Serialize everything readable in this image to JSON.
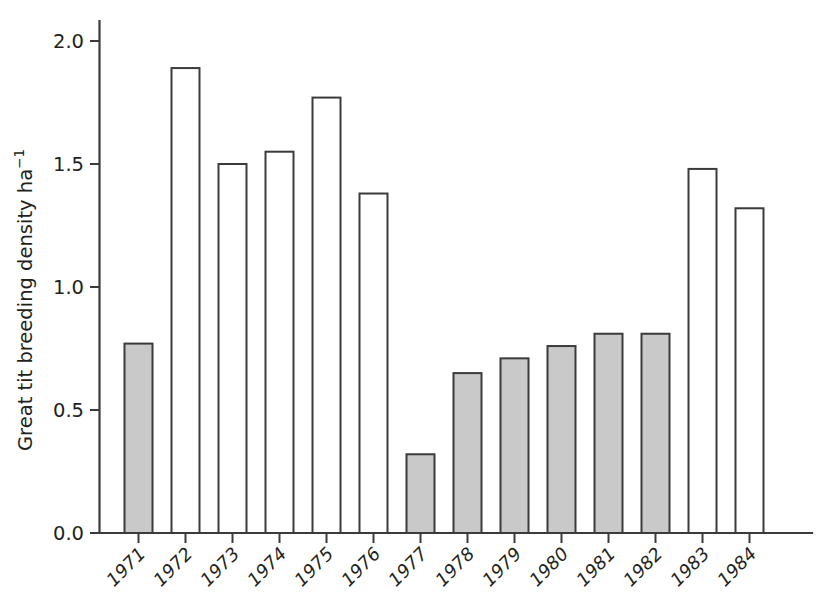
{
  "chart_data": {
    "type": "bar",
    "title": "",
    "subtitle": "",
    "xlabel": "",
    "ylabel": "Great tit breeding density ha",
    "ylabel_exponent": "−1",
    "ylabel_full": "Great tit breeding density ha⁻¹",
    "categories": [
      "1971",
      "1972",
      "1973",
      "1974",
      "1975",
      "1976",
      "1977",
      "1978",
      "1979",
      "1980",
      "1981",
      "1982",
      "1983",
      "1984"
    ],
    "values": [
      0.77,
      1.89,
      1.5,
      1.55,
      1.77,
      1.38,
      0.32,
      0.65,
      0.71,
      0.76,
      0.81,
      0.81,
      1.48,
      1.32
    ],
    "bar_styles": [
      "filled",
      "open",
      "open",
      "open",
      "open",
      "open",
      "filled",
      "filled",
      "filled",
      "filled",
      "filled",
      "filled",
      "open",
      "open"
    ],
    "ylim": [
      0.0,
      2.0
    ],
    "ytick_values": [
      0.0,
      0.5,
      1.0,
      1.5,
      2.0
    ],
    "ytick_labels": [
      "0.0",
      "0.5",
      "1.0",
      "1.5",
      "2.0"
    ],
    "grid": false,
    "legend": null,
    "legend_position": "none",
    "annotations": [],
    "colors": {
      "bar_filled": "#c9c9c9",
      "bar_open": "#ffffff",
      "bar_outline": "#3b3b3b",
      "axis": "#3b3b3b",
      "text": "#231f20",
      "background": "#ffffff"
    },
    "xtick_label_rotation_deg": -45
  }
}
